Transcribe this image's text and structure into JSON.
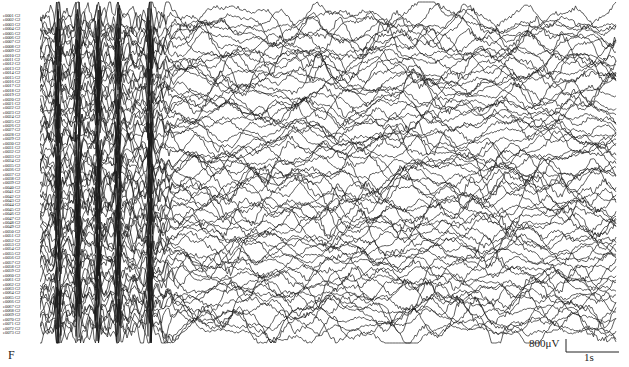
{
  "figure": {
    "panel_letter": "F",
    "scale": {
      "voltage_label": "800μV",
      "time_label": "1s"
    }
  },
  "chart_data": {
    "type": "line",
    "title": "",
    "xlabel": "",
    "ylabel": "",
    "channel_suffix": "G2",
    "channels": [
      "e0001",
      "e0002",
      "e0003",
      "e0004",
      "e0005",
      "e0006",
      "e0007",
      "e0008",
      "e0009",
      "e0010",
      "e0011",
      "e0012",
      "e0013",
      "e0014",
      "e0015",
      "e0016",
      "e0017",
      "e0018",
      "e0019",
      "e0020",
      "e0021",
      "e0022",
      "e0023",
      "e0024",
      "e0025",
      "e0026",
      "e0027",
      "e0028",
      "e0029",
      "e0030",
      "e0031",
      "e0032",
      "e0033",
      "e0034",
      "e0035",
      "e0036",
      "e0037",
      "e0038",
      "e0039",
      "e0040",
      "e0041",
      "e0042",
      "e0043",
      "e0044",
      "e0045",
      "e0046",
      "e0047",
      "e0048",
      "e0049",
      "e0050",
      "e0051",
      "e0052",
      "e0053",
      "e0054",
      "e0055",
      "e0056",
      "e0057",
      "e0058",
      "e0059",
      "e0060",
      "e0061",
      "e0062",
      "e0063",
      "e0064",
      "e0065",
      "e0066",
      "e0067",
      "e0068",
      "e0069",
      "e0070",
      "e0071",
      "e0072",
      "e0073"
    ],
    "time_span_s": 11,
    "scale_bar": {
      "amplitude_uV": 800,
      "duration_s": 1
    },
    "segments": [
      {
        "name": "ictal-spike-bursts",
        "x_start_frac": 0.0,
        "x_end_frac": 0.22,
        "relative_amplitude": 3.2,
        "burst_peaks_px": [
          58,
          78,
          98,
          118,
          150
        ]
      },
      {
        "name": "post-burst-slow",
        "x_start_frac": 0.22,
        "x_end_frac": 1.0,
        "relative_amplitude": 1.3
      }
    ],
    "trace_color": "#1a1a1a"
  }
}
